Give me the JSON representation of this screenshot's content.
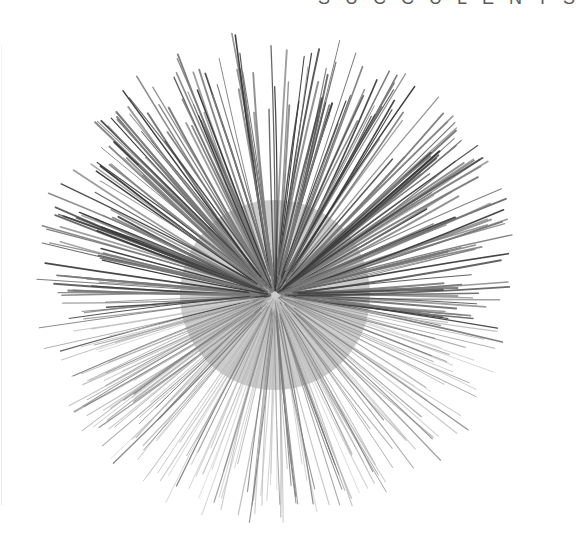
{
  "page": {
    "running_head": "SUCCULENTS",
    "background": "#ffffff"
  },
  "photo": {
    "subject": "spiky succulent rosette (top view)",
    "center": [
      275,
      295
    ],
    "radius_top": 255,
    "radius_side": 230,
    "radius_bottom": 225,
    "leaf_count": 420,
    "colors": {
      "dark": "#3a3a3a",
      "mid": "#7a7a7a",
      "light": "#b8b8b8"
    }
  }
}
